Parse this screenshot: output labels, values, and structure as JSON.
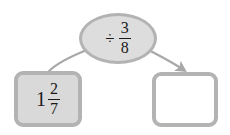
{
  "diagram": {
    "type": "function-machine",
    "background_color": "#ffffff",
    "shape_fill_gray": "#d9d9d9",
    "oval_fill_gray": "#dddddd",
    "border_gray": "#b3b3b3",
    "connector_gray": "#a8a8a8",
    "text_color": "#1a1a1a"
  },
  "operation": {
    "label": "÷ 3/8",
    "operator_symbol": "÷",
    "fraction": {
      "numerator": "3",
      "denominator": "8"
    }
  },
  "input": {
    "label": "1 2/7",
    "whole_number": "1",
    "fraction": {
      "numerator": "2",
      "denominator": "7"
    }
  },
  "output": {
    "label": "",
    "value": "",
    "is_blank": true
  },
  "connectors": [
    {
      "name": "input-to-operation",
      "from": "input-box",
      "to": "operation-oval",
      "has_arrowhead": false
    },
    {
      "name": "operation-to-output",
      "from": "operation-oval",
      "to": "output-box",
      "has_arrowhead": true
    }
  ]
}
